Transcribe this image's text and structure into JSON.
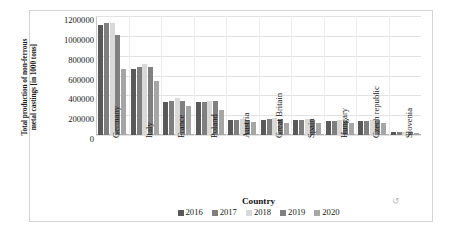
{
  "chart_data": {
    "type": "bar",
    "title": "",
    "xlabel": "Country",
    "ylabel": "Total production of non-ferrous metal castings [in 1000 tons]",
    "ylabel_line1": "Total production of non-ferrous",
    "ylabel_line2": "metal castings [in 1000 tons]",
    "ylim": [
      0,
      1200000
    ],
    "ytick_labels": [
      "1200000",
      "1000000",
      "800000",
      "600000",
      "400000",
      "200000",
      "0"
    ],
    "ytick_values": [
      1200000,
      1000000,
      800000,
      600000,
      400000,
      200000,
      0
    ],
    "grid": true,
    "legend_position": "bottom",
    "categories": [
      "Germany",
      "Italy",
      "France",
      "Poland",
      "Austria",
      "Great Britain",
      "Spain",
      "Hungary",
      "Czech republic",
      "Slovenia"
    ],
    "series": [
      {
        "name": "2016",
        "color": "#595959",
        "values": [
          1105000,
          665000,
          330000,
          330000,
          150000,
          150000,
          150000,
          140000,
          140000,
          30000
        ]
      },
      {
        "name": "2017",
        "color": "#7f7f7f",
        "values": [
          1125000,
          690000,
          345000,
          335000,
          155000,
          160000,
          155000,
          145000,
          145000,
          32000
        ]
      },
      {
        "name": "2018",
        "color": "#d9d9d9",
        "values": [
          1130000,
          715000,
          370000,
          345000,
          165000,
          175000,
          160000,
          150000,
          150000,
          33000
        ]
      },
      {
        "name": "2019",
        "color": "#808080",
        "values": [
          1010000,
          685000,
          345000,
          340000,
          155000,
          160000,
          150000,
          145000,
          148000,
          30000
        ]
      },
      {
        "name": "2020",
        "color": "#a6a6a6",
        "values": [
          665000,
          545000,
          290000,
          255000,
          130000,
          125000,
          125000,
          125000,
          120000,
          25000
        ]
      }
    ]
  },
  "artifact": {
    "glyph": "↺"
  }
}
